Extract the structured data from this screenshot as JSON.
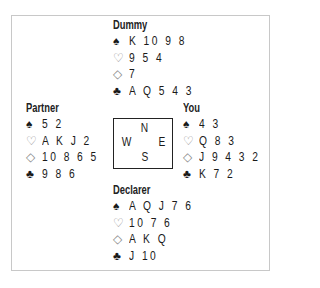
{
  "diagram": {
    "type": "bridge-deal",
    "suit_icons": {
      "spades": "spade-solid",
      "hearts": "heart-outline",
      "diamonds": "diamond-outline",
      "clubs": "club-solid"
    },
    "suit_glyphs": {
      "spades": "♠",
      "hearts": "♡",
      "diamonds": "◇",
      "clubs": "♣"
    },
    "compass": {
      "north": "N",
      "west": "W",
      "east": "E",
      "south": "S"
    },
    "hands": {
      "north": {
        "label": "Dummy",
        "spades": "K 10 9 8",
        "hearts": "9 5 4",
        "diamonds": "7",
        "clubs": "A Q 5 4 3"
      },
      "west": {
        "label": "Partner",
        "spades": "5 2",
        "hearts": "A K J 2",
        "diamonds": "10 8 6 5",
        "clubs": "9 8 6"
      },
      "east": {
        "label": "You",
        "spades": "4 3",
        "hearts": "Q 8 3",
        "diamonds": "J 9 4 3 2",
        "clubs": "K 7 2"
      },
      "south": {
        "label": "Declarer",
        "spades": "A Q J 7 6",
        "hearts": "10 7 6",
        "diamonds": "A K Q",
        "clubs": "J 10"
      }
    }
  }
}
